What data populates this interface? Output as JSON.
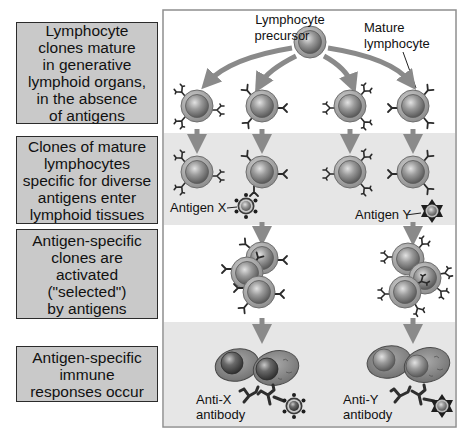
{
  "steps": [
    {
      "id": "maturation",
      "text": "Lymphocyte\nclones mature\nin generative\nlymphoid organs,\nin the absence\nof antigens"
    },
    {
      "id": "entry",
      "text": "Clones of mature\nlymphocytes\nspecific for diverse\nantigens enter\nlymphoid tissues"
    },
    {
      "id": "selection",
      "text": "Antigen-specific\nclones are\nactivated\n(\"selected\")\nby antigens"
    },
    {
      "id": "response",
      "text": "Antigen-specific\nimmune\nresponses occur"
    }
  ],
  "labels": {
    "precursor_line1": "Lymphocyte",
    "precursor_line2": "precursor",
    "mature_line1": "Mature",
    "mature_line2": "lymphocyte",
    "antigen_x": "Antigen X",
    "antigen_y": "Antigen Y",
    "anti_x_line1": "Anti-X",
    "anti_x_line2": "antibody",
    "anti_y_line1": "Anti-Y",
    "anti_y_line2": "antibody"
  },
  "colors": {
    "band_gray": "#e6e6e6",
    "box_gray": "#c9c9c9",
    "arrow_gray": "#8a8a8a",
    "cell_outer": "#a9a9a9",
    "cell_inner": "#8e8e8e",
    "receptor": "#2a2a2a"
  }
}
